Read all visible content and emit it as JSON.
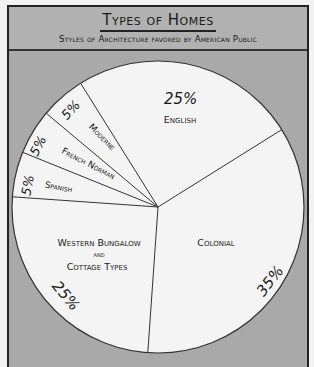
{
  "header": {
    "title": "Types of Homes",
    "subtitle": "Styles of Architecture favored by American Public"
  },
  "colors": {
    "background": "#a9a9a9",
    "header_bg": "#b1b1b1",
    "pie_fill": "#f4f4f4",
    "line": "#333333"
  },
  "chart_data": {
    "type": "pie",
    "title": "Types of Homes",
    "subtitle": "Styles of Architecture favored by American Public",
    "categories": [
      "English",
      "Colonial",
      "Western Bungalow and Cottage Types",
      "Spanish",
      "French Norman",
      "Moderne"
    ],
    "values": [
      25,
      35,
      25,
      5,
      5,
      5
    ],
    "unit": "%",
    "start_angle_deg": -32,
    "direction": "clockwise",
    "legend": "none (labels inside slices)"
  },
  "labels": {
    "english": "English",
    "colonial": "Colonial",
    "western_line1": "Western Bungalow",
    "western_line2": "and",
    "western_line3": "Cottage Types",
    "spanish": "Spanish",
    "french_norman": "French Norman",
    "moderne": "Moderne"
  },
  "percents": {
    "english": "25%",
    "colonial": "35%",
    "western": "25%",
    "spanish": "5%",
    "french_norman": "5%",
    "moderne": "5%"
  }
}
